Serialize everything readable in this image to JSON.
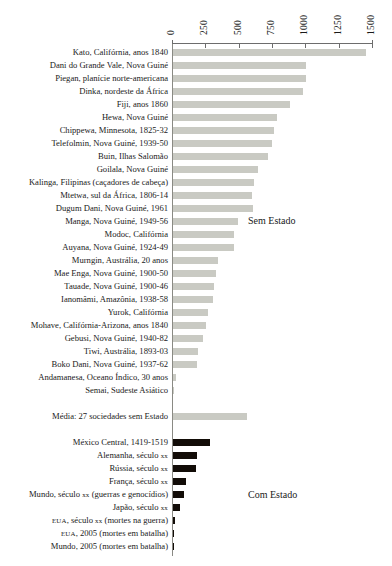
{
  "chart_data": {
    "type": "bar",
    "orientation": "horizontal",
    "title": "",
    "subtitle": "",
    "xlabel": "",
    "ylabel": "",
    "xlim": [
      0,
      1500
    ],
    "xticks": [
      "0",
      "250",
      "500",
      "750",
      "1000",
      "1250",
      "1500"
    ],
    "xtick_values": [
      0,
      250,
      500,
      750,
      1000,
      1250,
      1500
    ],
    "grid": false,
    "legend_position": "inline-annotation",
    "annotations": [
      {
        "text": "Sem Estado",
        "group": "stateless"
      },
      {
        "text": "Com Estado",
        "group": "state"
      }
    ],
    "series": [
      {
        "name": "Sem Estado",
        "color": "#c9cac3",
        "categories": [
          "Kato, Califórnia, anos 1840",
          "Dani do Grande Vale, Nova Guiné",
          "Piegan, planície norte-americana",
          "Dinka, nordeste da África",
          "Fiji, anos 1860",
          "Hewa, Nova Guiné",
          "Chippewa, Minnesota, 1825-32",
          "Telefolmin, Nova Guiné, 1939-50",
          "Buin, Ilhas Salomão",
          "Goilala, Nova Guiné",
          "Kalinga, Filipinas (caçadores de cabeça)",
          "Mtetwa, sul da África, 1806-14",
          "Dugum Dani, Nova Guiné, 1961",
          "Manga, Nova Guiné, 1949-56",
          "Modoc, Califórnia",
          "Auyana, Nova Guiné, 1924-49",
          "Murngin, Austrália, 20 anos",
          "Mae Enga, Nova Guiné, 1900-50",
          "Tauade, Nova Guiné, 1900-46",
          "Ianomâmi, Amazônia, 1938-58",
          "Yurok, Califórnia",
          "Mohave, Califórnia-Arizona, anos 1840",
          "Gebusi, Nova Guiné, 1940-82",
          "Tiwi, Austrália, 1893-03",
          "Boko Dani, Nova Guiné, 1937-62",
          "Andamanesa, Oceano Índico, 30 anos",
          "Semai, Sudeste Asiático"
        ],
        "values": [
          1450,
          1000,
          1000,
          975,
          880,
          780,
          755,
          745,
          715,
          640,
          610,
          590,
          600,
          490,
          460,
          460,
          340,
          325,
          310,
          300,
          265,
          250,
          225,
          190,
          180,
          20,
          3
        ]
      },
      {
        "name": "Média",
        "color": "#c9cac3",
        "categories": [
          "Média: 27 sociedades sem Estado"
        ],
        "values": [
          555
        ]
      },
      {
        "name": "Com Estado",
        "color": "#120c07",
        "categories": [
          "México Central, 1419-1519",
          "Alemanha, século xx",
          "Rússia, século xx",
          "França, século xx",
          "Mundo, século xx (guerras e genocídios)",
          "Japão, século xx",
          "EUA, século xx (mortes na guerra)",
          "EUA, 2005 (mortes em batalha)",
          "Mundo, 2005 (mortes em batalha)"
        ],
        "values": [
          280,
          180,
          172,
          100,
          85,
          55,
          15,
          2,
          2
        ]
      }
    ]
  },
  "rows": [
    {
      "label": "Kato, Califórnia, anos 1840",
      "value": 1450,
      "group": "stateless"
    },
    {
      "label": "Dani do Grande Vale, Nova Guiné",
      "value": 1000,
      "group": "stateless"
    },
    {
      "label": "Piegan, planície norte-americana",
      "value": 1000,
      "group": "stateless"
    },
    {
      "label": "Dinka, nordeste da África",
      "value": 975,
      "group": "stateless"
    },
    {
      "label": "Fiji, anos 1860",
      "value": 880,
      "group": "stateless"
    },
    {
      "label": "Hewa, Nova Guiné",
      "value": 780,
      "group": "stateless"
    },
    {
      "label": "Chippewa, Minnesota, 1825-32",
      "value": 755,
      "group": "stateless"
    },
    {
      "label": "Telefolmin, Nova Guiné, 1939-50",
      "value": 745,
      "group": "stateless"
    },
    {
      "label": "Buin, Ilhas Salomão",
      "value": 715,
      "group": "stateless"
    },
    {
      "label": "Goilala, Nova Guiné",
      "value": 640,
      "group": "stateless"
    },
    {
      "label": "Kalinga, Filipinas (caçadores de cabeça)",
      "value": 610,
      "group": "stateless"
    },
    {
      "label": "Mtetwa, sul da África, 1806-14",
      "value": 590,
      "group": "stateless"
    },
    {
      "label": "Dugum Dani, Nova Guiné, 1961",
      "value": 600,
      "group": "stateless"
    },
    {
      "label": "Manga, Nova Guiné, 1949-56",
      "value": 490,
      "group": "stateless"
    },
    {
      "label": "Modoc, Califórnia",
      "value": 460,
      "group": "stateless"
    },
    {
      "label": "Auyana, Nova Guiné, 1924-49",
      "value": 460,
      "group": "stateless"
    },
    {
      "label": "Murngin, Austrália, 20 anos",
      "value": 340,
      "group": "stateless"
    },
    {
      "label": "Mae Enga, Nova Guiné, 1900-50",
      "value": 325,
      "group": "stateless"
    },
    {
      "label": "Tauade, Nova Guiné, 1900-46",
      "value": 310,
      "group": "stateless"
    },
    {
      "label": "Ianomâmi, Amazônia, 1938-58",
      "value": 300,
      "group": "stateless"
    },
    {
      "label": "Yurok, Califórnia",
      "value": 265,
      "group": "stateless"
    },
    {
      "label": "Mohave, Califórnia-Arizona, anos 1840",
      "value": 250,
      "group": "stateless"
    },
    {
      "label": "Gebusi, Nova Guiné, 1940-82",
      "value": 225,
      "group": "stateless"
    },
    {
      "label": "Tiwi, Austrália, 1893-03",
      "value": 190,
      "group": "stateless"
    },
    {
      "label": "Boko Dani, Nova Guiné, 1937-62",
      "value": 180,
      "group": "stateless"
    },
    {
      "label": "Andamanesa, Oceano Índico, 30 anos",
      "value": 20,
      "group": "stateless"
    },
    {
      "label": "Semai, Sudeste Asiático",
      "value": 3,
      "group": "stateless"
    },
    {
      "label": "",
      "value": null,
      "group": "spacer"
    },
    {
      "label": "Média: 27 sociedades sem Estado",
      "value": 555,
      "group": "stateless"
    },
    {
      "label": "",
      "value": null,
      "group": "spacer"
    },
    {
      "label": "México Central, 1419-1519",
      "value": 280,
      "group": "state"
    },
    {
      "label": "Alemanha, século xx",
      "value": 180,
      "group": "state",
      "smallcaps": [
        "xx"
      ]
    },
    {
      "label": "Rússia, século xx",
      "value": 172,
      "group": "state",
      "smallcaps": [
        "xx"
      ]
    },
    {
      "label": "França, século xx",
      "value": 100,
      "group": "state",
      "smallcaps": [
        "xx"
      ]
    },
    {
      "label": "Mundo, século xx (guerras e genocídios)",
      "value": 85,
      "group": "state",
      "smallcaps": [
        "xx"
      ]
    },
    {
      "label": "Japão, século xx",
      "value": 55,
      "group": "state",
      "smallcaps": [
        "xx"
      ]
    },
    {
      "label": "EUA, século xx (mortes na guerra)",
      "value": 15,
      "group": "state",
      "smallcaps": [
        "EUA",
        "xx"
      ]
    },
    {
      "label": "EUA, 2005 (mortes em batalha)",
      "value": 2,
      "group": "state",
      "smallcaps": [
        "EUA"
      ]
    },
    {
      "label": "Mundo, 2005 (mortes em batalha)",
      "value": 2,
      "group": "state"
    }
  ],
  "axis": {
    "ticks": [
      "0",
      "250",
      "500",
      "750",
      "1000",
      "1250",
      "1500"
    ],
    "max": 1500
  },
  "notes": {
    "stateless": "Sem Estado",
    "state": "Com Estado"
  },
  "colors": {
    "stateless_bar": "#c9cac3",
    "state_bar": "#120c07",
    "axis": "#6d6d6d",
    "text": "#1a1a1a"
  }
}
